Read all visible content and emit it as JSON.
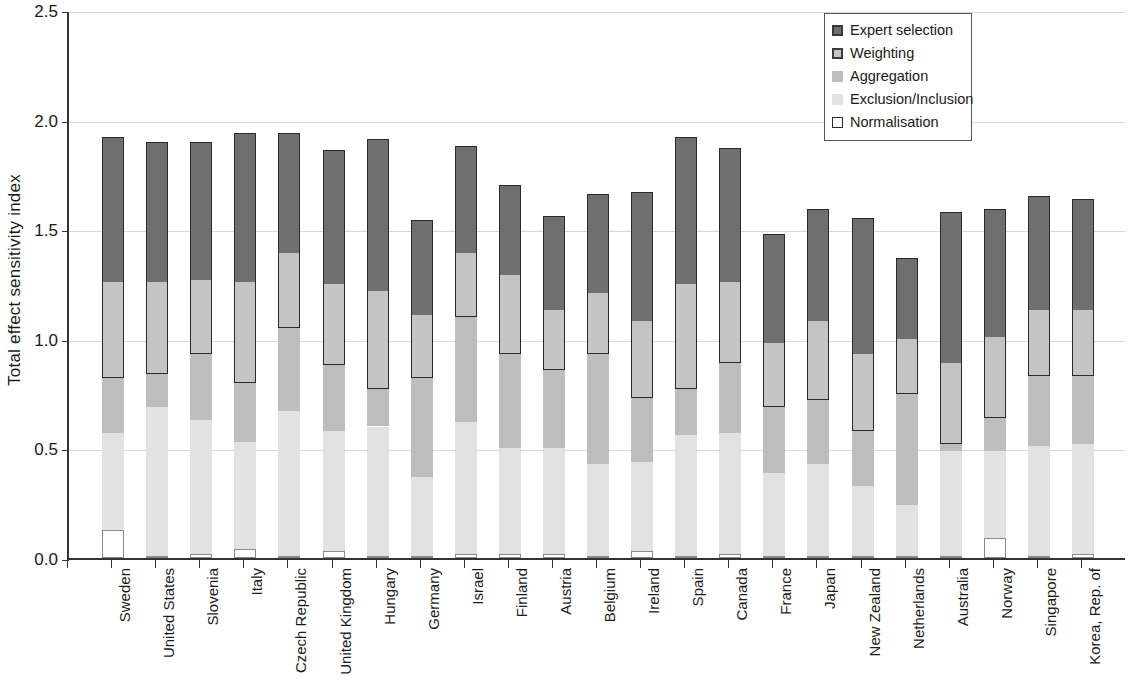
{
  "chart_data": {
    "type": "bar",
    "subtype": "stacked-vertical",
    "title": "",
    "xlabel": "",
    "ylabel": "Total effect sensitivity index",
    "ylim": [
      0.0,
      2.5
    ],
    "ytick_labels": [
      "0.0",
      "0.5",
      "1.0",
      "1.5",
      "2.0",
      "2.5"
    ],
    "ytick_values": [
      0.0,
      0.5,
      1.0,
      1.5,
      2.0,
      2.5
    ],
    "grid": true,
    "grid_axis": "y",
    "legend_position": "top-right",
    "categories": [
      "Sweden",
      "United States",
      "Slovenia",
      "Italy",
      "Czech Republic",
      "United Kingdom",
      "Hungary",
      "Germany",
      "Israel",
      "Finland",
      "Austria",
      "Belgium",
      "Ireland",
      "Spain",
      "Canada",
      "France",
      "Japan",
      "New Zealand",
      "Netherlands",
      "Australia",
      "Norway",
      "Singapore",
      "Korea, Rep. of"
    ],
    "series": [
      {
        "name": "Normalisation",
        "color": "#ffffff",
        "values": [
          0.13,
          0.01,
          0.02,
          0.04,
          0.01,
          0.03,
          0.01,
          0.01,
          0.02,
          0.02,
          0.02,
          0.01,
          0.03,
          0.01,
          0.02,
          0.01,
          0.01,
          0.01,
          0.01,
          0.01,
          0.09,
          0.01,
          0.02
        ]
      },
      {
        "name": "Exclusion/Inclusion",
        "color": "#e2e2e2",
        "values": [
          0.44,
          0.68,
          0.61,
          0.49,
          0.66,
          0.55,
          0.59,
          0.36,
          0.6,
          0.48,
          0.48,
          0.42,
          0.41,
          0.55,
          0.55,
          0.38,
          0.42,
          0.32,
          0.23,
          0.48,
          0.4,
          0.5,
          0.5
        ]
      },
      {
        "name": "Aggregation",
        "color": "#bdbdbd",
        "values": [
          0.25,
          0.15,
          0.3,
          0.27,
          0.38,
          0.3,
          0.17,
          0.45,
          0.48,
          0.43,
          0.36,
          0.5,
          0.29,
          0.21,
          0.32,
          0.3,
          0.29,
          0.25,
          0.51,
          0.03,
          0.15,
          0.32,
          0.31
        ]
      },
      {
        "name": "Weighting",
        "color": "#c4c4c4",
        "values": [
          0.44,
          0.42,
          0.34,
          0.46,
          0.34,
          0.37,
          0.45,
          0.29,
          0.29,
          0.36,
          0.27,
          0.28,
          0.35,
          0.48,
          0.37,
          0.29,
          0.36,
          0.35,
          0.25,
          0.37,
          0.37,
          0.3,
          0.3
        ]
      },
      {
        "name": "Expert selection",
        "color": "#6f6f6f",
        "values": [
          0.66,
          0.64,
          0.63,
          0.68,
          0.55,
          0.61,
          0.69,
          0.43,
          0.49,
          0.41,
          0.43,
          0.45,
          0.59,
          0.67,
          0.61,
          0.5,
          0.51,
          0.62,
          0.37,
          0.69,
          0.58,
          0.52,
          0.51
        ]
      }
    ],
    "totals": [
      1.92,
      1.9,
      1.9,
      1.94,
      1.94,
      1.86,
      1.91,
      1.54,
      1.88,
      1.7,
      1.56,
      1.66,
      1.67,
      1.92,
      1.87,
      1.48,
      1.59,
      1.55,
      1.37,
      1.58,
      1.59,
      1.65,
      1.64
    ]
  },
  "legend": {
    "items": [
      {
        "label": "Expert selection",
        "swatch": "expert",
        "icon": "square-dark-icon"
      },
      {
        "label": "Weighting",
        "swatch": "weighting",
        "icon": "square-mid-icon"
      },
      {
        "label": "Aggregation",
        "swatch": "aggregation",
        "icon": "square-light-icon"
      },
      {
        "label": "Exclusion/Inclusion",
        "swatch": "exclusion",
        "icon": "square-pale-icon"
      },
      {
        "label": "Normalisation",
        "swatch": "normalisation",
        "icon": "square-white-icon"
      }
    ]
  },
  "colors": {
    "expert": "#6f6f6f",
    "weighting": "#c4c4c4",
    "aggregation": "#bdbdbd",
    "exclusion": "#e2e2e2",
    "normalisation": "#ffffff",
    "axis": "#333333",
    "grid": "#d9d9d9"
  }
}
